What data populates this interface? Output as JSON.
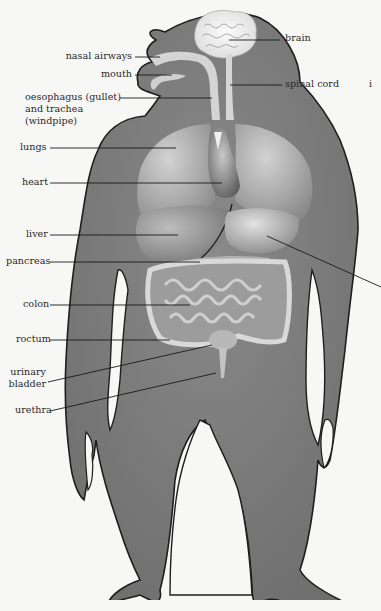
{
  "diagram": {
    "colors": {
      "background": "#f7f7f5",
      "body": "#7e7e7e",
      "outline": "#1e1e1e",
      "organ_light": "#d8d8d8",
      "organ_mid": "#a9a9a9",
      "organ_dark": "#555555",
      "leader_line": "#1a1a1a",
      "text": "#2a2a2a"
    },
    "labels": {
      "brain": "brain",
      "nasal_airways": "nasal airways",
      "mouth": "mouth",
      "spinal_cord": "spinal cord",
      "oesophagus_line1": "oesophagus (gullet)",
      "oesophagus_line2": "and trachea",
      "oesophagus_line3": "(windpipe)",
      "lungs": "lungs",
      "heart": "heart",
      "liver": "liver",
      "pancreas": "pancreas",
      "colon": "colon",
      "rectum": "roctum",
      "urinary_line1": "urinary",
      "urinary_line2": "bladder",
      "urethra": "urethra",
      "cut_off_right": "i"
    }
  }
}
